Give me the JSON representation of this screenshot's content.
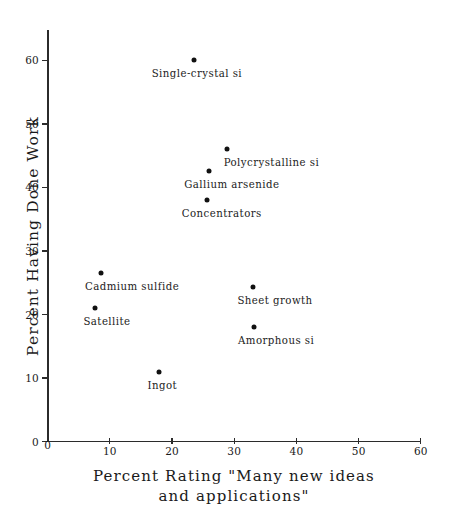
{
  "chart_data": {
    "type": "scatter",
    "title": "",
    "xlabel": "Percent Rating \"Many new ideas and applications\"",
    "xlabel_line1": "Percent Rating \"Many new ideas",
    "xlabel_line2": "and applications\"",
    "ylabel": "Percent Having Done Work",
    "xlim": [
      0,
      61
    ],
    "ylim": [
      0,
      63
    ],
    "xticks": [
      0,
      10,
      20,
      30,
      40,
      50,
      60
    ],
    "xtick_labels": [
      "0",
      "10",
      "20",
      "30",
      "40",
      "50",
      "60"
    ],
    "yticks": [
      0,
      10,
      20,
      30,
      40,
      50,
      60
    ],
    "ytick_labels": [
      "0",
      "10",
      "20",
      "30",
      "40",
      "50",
      "60"
    ],
    "grid": false,
    "legend": "none",
    "marker": "filled-circle",
    "marker_color": "#111111",
    "points": [
      {
        "label": "Single-crystal si",
        "x": 23.5,
        "y": 60.0,
        "label_dx": -42,
        "label_dy": 9
      },
      {
        "label": "Polycrystalline si",
        "x": 28.8,
        "y": 46.1,
        "label_dx": -3,
        "label_dy": 9
      },
      {
        "label": "Gallium arsenide",
        "x": 26.0,
        "y": 42.5,
        "label_dx": -25,
        "label_dy": 9
      },
      {
        "label": "Concentrators",
        "x": 25.6,
        "y": 38.0,
        "label_dx": -25,
        "label_dy": 9
      },
      {
        "label": "Cadmium sulfide",
        "x": 8.6,
        "y": 26.5,
        "label_dx": -16,
        "label_dy": 9
      },
      {
        "label": "Sheet growth",
        "x": 33.1,
        "y": 24.3,
        "label_dx": -16,
        "label_dy": 9
      },
      {
        "label": "Satellite",
        "x": 7.7,
        "y": 21.0,
        "label_dx": -12,
        "label_dy": 9
      },
      {
        "label": "Amorphous si",
        "x": 33.2,
        "y": 18.0,
        "label_dx": -16,
        "label_dy": 9
      },
      {
        "label": "Ingot",
        "x": 18.0,
        "y": 11.0,
        "label_dx": -12,
        "label_dy": 9
      }
    ]
  },
  "axes": {
    "x_title_line1": "Percent Rating \"Many new ideas",
    "x_title_line2": "and applications\"",
    "y_title": "Percent Having Done Work"
  }
}
